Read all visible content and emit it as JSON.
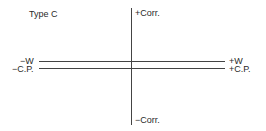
{
  "diagram": {
    "title": "Type C",
    "axes": {
      "vertical": {
        "top_label": "+Corr.",
        "bottom_label": "−Corr."
      },
      "horizontal_lines": [
        {
          "left_label": "−W",
          "right_label": "+W"
        },
        {
          "left_label": "−C.P.",
          "right_label": "+C.P."
        }
      ]
    },
    "colors": {
      "line": "#444444",
      "text": "#2a2a2a",
      "background": "#ffffff"
    }
  }
}
